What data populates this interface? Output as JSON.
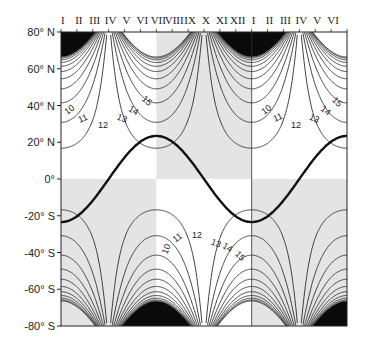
{
  "chart_data": {
    "type": "line",
    "title": "",
    "xlabel": "",
    "ylabel": "",
    "x_ticks_top": [
      "I",
      "II",
      "III",
      "IV",
      "V",
      "VI",
      "VII",
      "VIII",
      "IX",
      "X",
      "XI",
      "XII",
      "I",
      "II",
      "III",
      "IV",
      "V",
      "VI"
    ],
    "y_ticks": [
      "80° N",
      "60° N",
      "40° N",
      "20° N",
      "0°",
      "-20° S",
      "-40° S",
      "-60° S",
      "-80° S"
    ],
    "y_values": [
      80,
      60,
      40,
      20,
      0,
      -20,
      -40,
      -60,
      -80
    ],
    "ylim": [
      -80,
      80
    ],
    "x_range_months": [
      0,
      18
    ],
    "grid": false,
    "series": [
      {
        "name": "solar declination (subsolar latitude)",
        "style": "thick",
        "points": [
          [
            0,
            -23.5
          ],
          [
            3,
            0
          ],
          [
            6,
            23.5
          ],
          [
            9,
            0
          ],
          [
            12,
            -23.5
          ],
          [
            15,
            0
          ],
          [
            18,
            23.5
          ]
        ]
      }
    ],
    "contour_levels": [
      10,
      11,
      12,
      13,
      14,
      15
    ],
    "contour_label_groups": [
      {
        "hemisphere": "N",
        "near_month": 3,
        "labels": [
          "10",
          "11",
          "12",
          "13",
          "14",
          "15"
        ]
      },
      {
        "hemisphere": "N",
        "near_month": 15,
        "labels": [
          "10",
          "11",
          "12",
          "13",
          "14",
          "15"
        ]
      },
      {
        "hemisphere": "S",
        "near_month": 9,
        "labels": [
          "10",
          "11",
          "12",
          "13",
          "14",
          "15"
        ]
      }
    ],
    "shaded_regions": [
      {
        "hemisphere": "N",
        "from_month": 6,
        "to_month": 12,
        "color": "#e4e4e4"
      },
      {
        "hemisphere": "S",
        "from_month": 0,
        "to_month": 6,
        "color": "#e4e4e4"
      },
      {
        "hemisphere": "S",
        "from_month": 12,
        "to_month": 18,
        "color": "#e4e4e4"
      }
    ],
    "polar_night_regions": [
      {
        "hemisphere": "N",
        "center_month": 0,
        "half_width_months": 1.8,
        "max_extent_lat": 66.5
      },
      {
        "hemisphere": "N",
        "center_month": 12,
        "half_width_months": 4.1,
        "max_extent_lat": 66.5
      },
      {
        "hemisphere": "S",
        "center_month": 6,
        "half_width_months": 2.8,
        "max_extent_lat": -66.5
      },
      {
        "hemisphere": "S",
        "center_month": 18,
        "half_width_months": 2.7,
        "max_extent_lat": -66.5
      }
    ],
    "vertical_lines_month": [
      12
    ],
    "colors": {
      "polar_night": "#0a0a0a",
      "shade": "#e4e4e4",
      "line": "#2a2a2a",
      "thick": "#111111"
    }
  }
}
